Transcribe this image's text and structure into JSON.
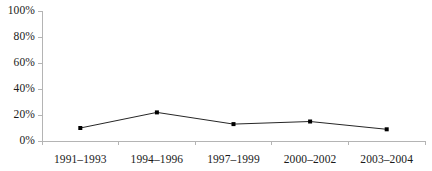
{
  "chart_data": {
    "type": "line",
    "title": "",
    "subtitle": "",
    "xlabel": "",
    "ylabel": "",
    "categories": [
      "1991–1993",
      "1994–1996",
      "1997–1999",
      "2000–2002",
      "2003–2004"
    ],
    "values": [
      10,
      22,
      13,
      15,
      9
    ],
    "series": [
      {
        "name": "",
        "values": [
          10,
          22,
          13,
          15,
          9
        ]
      }
    ],
    "ylim": [
      0,
      100
    ],
    "yticks": [
      0,
      20,
      40,
      60,
      80,
      100
    ],
    "ytick_labels": [
      "0%",
      "20%",
      "40%",
      "60%",
      "80%",
      "100%"
    ],
    "xtick_labels": [
      "1991–1993",
      "1994–1996",
      "1997–1999",
      "2000–2002",
      "2003–2004"
    ],
    "grid": false,
    "legend": null,
    "legend_position": "none",
    "annotations": [],
    "marker": "square",
    "line_color": "#262626",
    "marker_color": "#000000",
    "axis_color": "#b4b4b4",
    "text_color": "#1a1a1a"
  },
  "geometry": {
    "plot_left": 42,
    "plot_right": 425,
    "plot_top": 11,
    "plot_bottom": 141,
    "band_width": 76.6,
    "tick_length": 4,
    "marker_size": 4,
    "line_width": 1
  }
}
